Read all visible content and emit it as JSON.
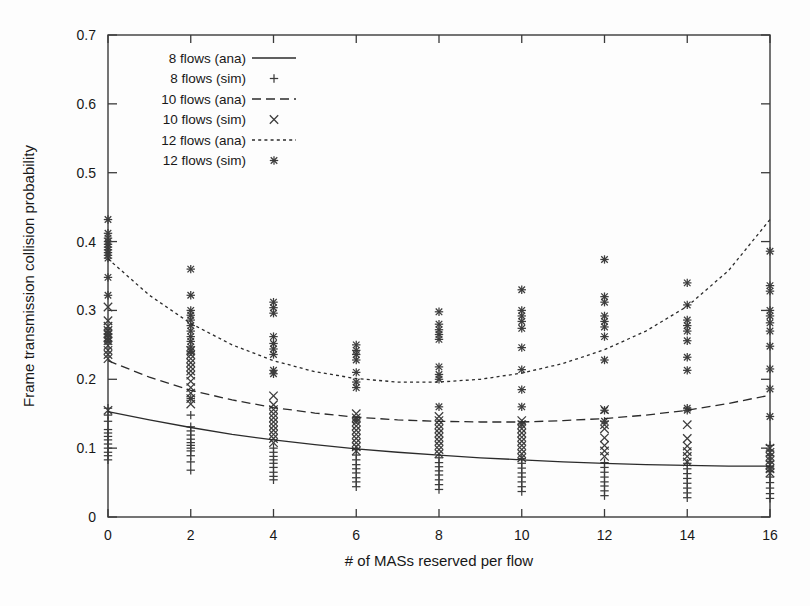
{
  "chart_data": {
    "type": "scatter",
    "title": "",
    "xlabel": "# of MASs reserved per flow",
    "ylabel": "Frame transmission collision probability",
    "xlim": [
      0,
      16
    ],
    "ylim": [
      0,
      0.7
    ],
    "xticks": [
      "0",
      "2",
      "4",
      "6",
      "8",
      "10",
      "12",
      "14",
      "16"
    ],
    "xtick_values": [
      0,
      2,
      4,
      6,
      8,
      10,
      12,
      14,
      16
    ],
    "yticks": [
      "0",
      "0.1",
      "0.2",
      "0.3",
      "0.4",
      "0.5",
      "0.6",
      "0.7"
    ],
    "ytick_values": [
      0,
      0.1,
      0.2,
      0.3,
      0.4,
      0.5,
      0.6,
      0.7
    ],
    "grid": false,
    "legend_position": "top-left",
    "legend": [
      {
        "label": "8 flows (ana)",
        "kind": "line",
        "style": "solid"
      },
      {
        "label": "8 flows (sim)",
        "kind": "marker",
        "style": "plus"
      },
      {
        "label": "10 flows (ana)",
        "kind": "line",
        "style": "dashed"
      },
      {
        "label": "10 flows (sim)",
        "kind": "marker",
        "style": "cross"
      },
      {
        "label": "12 flows (ana)",
        "kind": "line",
        "style": "dotted"
      },
      {
        "label": "12 flows (sim)",
        "kind": "marker",
        "style": "star"
      }
    ],
    "series": [
      {
        "name": "8 flows (ana)",
        "kind": "line",
        "style": "solid",
        "x": [
          0,
          1,
          2,
          3,
          4,
          5,
          6,
          7,
          8,
          9,
          10,
          11,
          12,
          13,
          14,
          15,
          16
        ],
        "values": [
          0.153,
          0.141,
          0.13,
          0.12,
          0.112,
          0.105,
          0.099,
          0.094,
          0.09,
          0.086,
          0.083,
          0.08,
          0.078,
          0.076,
          0.075,
          0.074,
          0.074
        ]
      },
      {
        "name": "10 flows (ana)",
        "kind": "line",
        "style": "dashed",
        "x": [
          0,
          1,
          2,
          3,
          4,
          5,
          6,
          7,
          8,
          9,
          10,
          11,
          12,
          13,
          14,
          15,
          16
        ],
        "values": [
          0.227,
          0.203,
          0.184,
          0.17,
          0.159,
          0.151,
          0.145,
          0.141,
          0.139,
          0.138,
          0.138,
          0.14,
          0.143,
          0.148,
          0.155,
          0.165,
          0.177
        ]
      },
      {
        "name": "12 flows (ana)",
        "kind": "line",
        "style": "dotted",
        "x": [
          0,
          1,
          2,
          3,
          4,
          5,
          6,
          7,
          8,
          9,
          10,
          11,
          12,
          13,
          14,
          15,
          16
        ],
        "values": [
          0.375,
          0.322,
          0.281,
          0.25,
          0.227,
          0.211,
          0.201,
          0.196,
          0.196,
          0.2,
          0.209,
          0.223,
          0.243,
          0.27,
          0.306,
          0.358,
          0.432
        ]
      },
      {
        "name": "8 flows (sim)",
        "kind": "marker",
        "style": "plus",
        "points": [
          [
            0,
            0.158
          ],
          [
            0,
            0.148
          ],
          [
            0,
            0.139
          ],
          [
            0,
            0.127
          ],
          [
            0,
            0.122
          ],
          [
            0,
            0.117
          ],
          [
            0,
            0.112
          ],
          [
            0,
            0.106
          ],
          [
            0,
            0.1
          ],
          [
            0,
            0.094
          ],
          [
            0,
            0.089
          ],
          [
            0,
            0.083
          ],
          [
            2,
            0.148
          ],
          [
            2,
            0.131
          ],
          [
            2,
            0.125
          ],
          [
            2,
            0.119
          ],
          [
            2,
            0.113
          ],
          [
            2,
            0.108
          ],
          [
            2,
            0.104
          ],
          [
            2,
            0.1
          ],
          [
            2,
            0.096
          ],
          [
            2,
            0.089
          ],
          [
            2,
            0.08
          ],
          [
            2,
            0.068
          ],
          [
            4,
            0.1
          ],
          [
            4,
            0.094
          ],
          [
            4,
            0.088
          ],
          [
            4,
            0.083
          ],
          [
            4,
            0.078
          ],
          [
            4,
            0.072
          ],
          [
            4,
            0.065
          ],
          [
            4,
            0.059
          ],
          [
            4,
            0.054
          ],
          [
            6,
            0.098
          ],
          [
            6,
            0.09
          ],
          [
            6,
            0.083
          ],
          [
            6,
            0.076
          ],
          [
            6,
            0.07
          ],
          [
            6,
            0.064
          ],
          [
            6,
            0.057
          ],
          [
            6,
            0.051
          ],
          [
            6,
            0.044
          ],
          [
            8,
            0.086
          ],
          [
            8,
            0.079
          ],
          [
            8,
            0.073
          ],
          [
            8,
            0.067
          ],
          [
            8,
            0.061
          ],
          [
            8,
            0.054
          ],
          [
            8,
            0.047
          ],
          [
            8,
            0.04
          ],
          [
            10,
            0.085
          ],
          [
            10,
            0.078
          ],
          [
            10,
            0.071
          ],
          [
            10,
            0.064
          ],
          [
            10,
            0.058
          ],
          [
            10,
            0.051
          ],
          [
            10,
            0.044
          ],
          [
            10,
            0.037
          ],
          [
            12,
            0.079
          ],
          [
            12,
            0.072
          ],
          [
            12,
            0.065
          ],
          [
            12,
            0.058
          ],
          [
            12,
            0.051
          ],
          [
            12,
            0.045
          ],
          [
            12,
            0.038
          ],
          [
            12,
            0.031
          ],
          [
            14,
            0.078
          ],
          [
            14,
            0.07
          ],
          [
            14,
            0.063
          ],
          [
            14,
            0.056
          ],
          [
            14,
            0.049
          ],
          [
            14,
            0.042
          ],
          [
            14,
            0.035
          ],
          [
            14,
            0.028
          ],
          [
            16,
            0.104
          ],
          [
            16,
            0.096
          ],
          [
            16,
            0.089
          ],
          [
            16,
            0.081
          ],
          [
            16,
            0.073
          ],
          [
            16,
            0.066
          ],
          [
            16,
            0.058
          ],
          [
            16,
            0.05
          ],
          [
            16,
            0.042
          ],
          [
            16,
            0.034
          ],
          [
            16,
            0.027
          ]
        ]
      },
      {
        "name": "10 flows (sim)",
        "kind": "marker",
        "style": "cross",
        "points": [
          [
            0,
            0.305
          ],
          [
            0,
            0.285
          ],
          [
            0,
            0.277
          ],
          [
            0,
            0.271
          ],
          [
            0,
            0.266
          ],
          [
            0,
            0.261
          ],
          [
            0,
            0.256
          ],
          [
            0,
            0.249
          ],
          [
            0,
            0.242
          ],
          [
            0,
            0.236
          ],
          [
            0,
            0.23
          ],
          [
            0,
            0.155
          ],
          [
            2,
            0.242
          ],
          [
            2,
            0.236
          ],
          [
            2,
            0.23
          ],
          [
            2,
            0.224
          ],
          [
            2,
            0.218
          ],
          [
            2,
            0.212
          ],
          [
            2,
            0.206
          ],
          [
            2,
            0.197
          ],
          [
            2,
            0.188
          ],
          [
            2,
            0.18
          ],
          [
            2,
            0.172
          ],
          [
            2,
            0.164
          ],
          [
            4,
            0.176
          ],
          [
            4,
            0.163
          ],
          [
            4,
            0.156
          ],
          [
            4,
            0.15
          ],
          [
            4,
            0.144
          ],
          [
            4,
            0.138
          ],
          [
            4,
            0.132
          ],
          [
            4,
            0.126
          ],
          [
            4,
            0.12
          ],
          [
            4,
            0.114
          ],
          [
            4,
            0.108
          ],
          [
            6,
            0.15
          ],
          [
            6,
            0.144
          ],
          [
            6,
            0.138
          ],
          [
            6,
            0.132
          ],
          [
            6,
            0.126
          ],
          [
            6,
            0.12
          ],
          [
            6,
            0.114
          ],
          [
            6,
            0.108
          ],
          [
            6,
            0.102
          ],
          [
            6,
            0.096
          ],
          [
            8,
            0.146
          ],
          [
            8,
            0.14
          ],
          [
            8,
            0.134
          ],
          [
            8,
            0.128
          ],
          [
            8,
            0.122
          ],
          [
            8,
            0.116
          ],
          [
            8,
            0.11
          ],
          [
            8,
            0.104
          ],
          [
            8,
            0.098
          ],
          [
            8,
            0.092
          ],
          [
            10,
            0.14
          ],
          [
            10,
            0.134
          ],
          [
            10,
            0.128
          ],
          [
            10,
            0.122
          ],
          [
            10,
            0.116
          ],
          [
            10,
            0.11
          ],
          [
            10,
            0.104
          ],
          [
            10,
            0.098
          ],
          [
            10,
            0.092
          ],
          [
            10,
            0.086
          ],
          [
            12,
            0.156
          ],
          [
            12,
            0.134
          ],
          [
            12,
            0.128
          ],
          [
            12,
            0.115
          ],
          [
            12,
            0.104
          ],
          [
            12,
            0.096
          ],
          [
            12,
            0.088
          ],
          [
            14,
            0.134
          ],
          [
            14,
            0.114
          ],
          [
            14,
            0.103
          ],
          [
            14,
            0.095
          ],
          [
            14,
            0.088
          ],
          [
            14,
            0.08
          ],
          [
            16,
            0.1
          ],
          [
            16,
            0.094
          ],
          [
            16,
            0.088
          ],
          [
            16,
            0.082
          ],
          [
            16,
            0.076
          ],
          [
            16,
            0.07
          ],
          [
            16,
            0.064
          ]
        ]
      },
      {
        "name": "12 flows (sim)",
        "kind": "marker",
        "style": "star",
        "points": [
          [
            0,
            0.432
          ],
          [
            0,
            0.412
          ],
          [
            0,
            0.405
          ],
          [
            0,
            0.4
          ],
          [
            0,
            0.396
          ],
          [
            0,
            0.392
          ],
          [
            0,
            0.388
          ],
          [
            0,
            0.384
          ],
          [
            0,
            0.38
          ],
          [
            0,
            0.376
          ],
          [
            0,
            0.348
          ],
          [
            0,
            0.322
          ],
          [
            0,
            0.27
          ],
          [
            0,
            0.265
          ],
          [
            0,
            0.26
          ],
          [
            0,
            0.255
          ],
          [
            2,
            0.36
          ],
          [
            2,
            0.322
          ],
          [
            2,
            0.3
          ],
          [
            2,
            0.293
          ],
          [
            2,
            0.286
          ],
          [
            2,
            0.278
          ],
          [
            2,
            0.27
          ],
          [
            2,
            0.262
          ],
          [
            2,
            0.255
          ],
          [
            2,
            0.247
          ],
          [
            2,
            0.24
          ],
          [
            2,
            0.172
          ],
          [
            4,
            0.312
          ],
          [
            4,
            0.304
          ],
          [
            4,
            0.296
          ],
          [
            4,
            0.262
          ],
          [
            4,
            0.252
          ],
          [
            4,
            0.244
          ],
          [
            4,
            0.236
          ],
          [
            4,
            0.213
          ],
          [
            4,
            0.208
          ],
          [
            6,
            0.25
          ],
          [
            6,
            0.242
          ],
          [
            6,
            0.236
          ],
          [
            6,
            0.228
          ],
          [
            6,
            0.21
          ],
          [
            6,
            0.196
          ],
          [
            6,
            0.188
          ],
          [
            6,
            0.141
          ],
          [
            8,
            0.298
          ],
          [
            8,
            0.28
          ],
          [
            8,
            0.272
          ],
          [
            8,
            0.265
          ],
          [
            8,
            0.258
          ],
          [
            8,
            0.218
          ],
          [
            8,
            0.207
          ],
          [
            8,
            0.2
          ],
          [
            8,
            0.16
          ],
          [
            10,
            0.33
          ],
          [
            10,
            0.3
          ],
          [
            10,
            0.292
          ],
          [
            10,
            0.284
          ],
          [
            10,
            0.274
          ],
          [
            10,
            0.246
          ],
          [
            10,
            0.214
          ],
          [
            10,
            0.185
          ],
          [
            10,
            0.16
          ],
          [
            10,
            0.135
          ],
          [
            12,
            0.374
          ],
          [
            12,
            0.32
          ],
          [
            12,
            0.312
          ],
          [
            12,
            0.292
          ],
          [
            12,
            0.284
          ],
          [
            12,
            0.276
          ],
          [
            12,
            0.262
          ],
          [
            12,
            0.228
          ],
          [
            12,
            0.155
          ],
          [
            12,
            0.139
          ],
          [
            14,
            0.34
          ],
          [
            14,
            0.308
          ],
          [
            14,
            0.286
          ],
          [
            14,
            0.278
          ],
          [
            14,
            0.27
          ],
          [
            14,
            0.256
          ],
          [
            14,
            0.232
          ],
          [
            14,
            0.213
          ],
          [
            14,
            0.158
          ],
          [
            14,
            0.155
          ],
          [
            16,
            0.386
          ],
          [
            16,
            0.336
          ],
          [
            16,
            0.328
          ],
          [
            16,
            0.3
          ],
          [
            16,
            0.292
          ],
          [
            16,
            0.282
          ],
          [
            16,
            0.27
          ],
          [
            16,
            0.248
          ],
          [
            16,
            0.215
          ],
          [
            16,
            0.186
          ],
          [
            16,
            0.146
          ],
          [
            16,
            0.07
          ]
        ]
      }
    ]
  }
}
